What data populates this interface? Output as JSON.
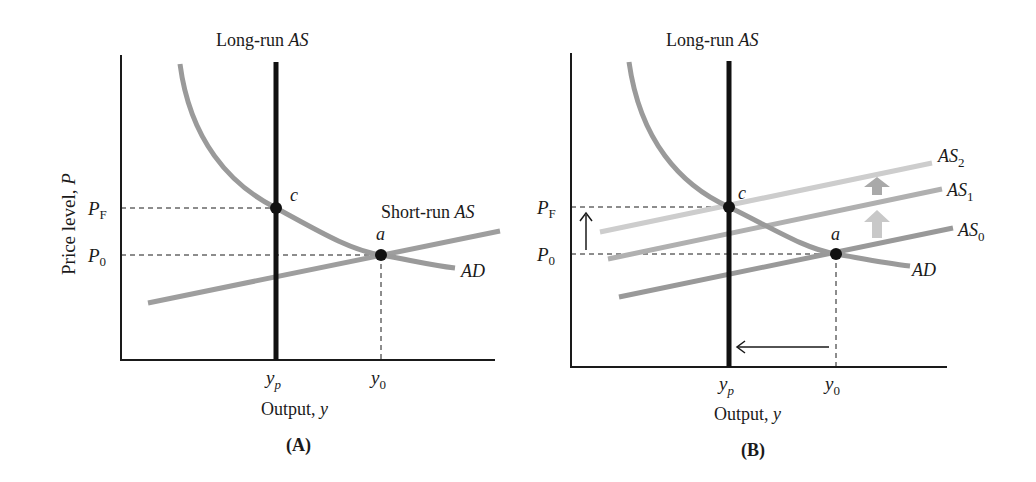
{
  "panels": [
    {
      "id": "A",
      "caption": "(A)",
      "top_label_prefix": "Long-run ",
      "top_label_italic": "AS",
      "y_axis_label_prefix": "Price level, ",
      "y_axis_label_italic": "P",
      "x_axis_label_prefix": "Output, ",
      "x_axis_label_italic": "y",
      "y_ticks": [
        {
          "main": "P",
          "sub": "F"
        },
        {
          "main": "P",
          "sub": "0"
        }
      ],
      "x_ticks": [
        {
          "main": "y",
          "sub": "p"
        },
        {
          "main": "y",
          "sub": "0"
        }
      ],
      "points": [
        {
          "label": "c"
        },
        {
          "label": "a"
        }
      ],
      "curves": {
        "srас_label_prefix": "Short-run ",
        "sras_label_italic": "AS",
        "ad_label": "AD"
      }
    },
    {
      "id": "B",
      "caption": "(B)",
      "top_label_prefix": "Long-run ",
      "top_label_italic": "AS",
      "x_axis_label_prefix": "Output, ",
      "x_axis_label_italic": "y",
      "y_ticks": [
        {
          "main": "P",
          "sub": "F"
        },
        {
          "main": "P",
          "sub": "0"
        }
      ],
      "x_ticks": [
        {
          "main": "y",
          "sub": "p"
        },
        {
          "main": "y",
          "sub": "0"
        }
      ],
      "points": [
        {
          "label": "c"
        },
        {
          "label": "a"
        }
      ],
      "curves": {
        "as_labels": [
          {
            "main": "AS",
            "sub": "2"
          },
          {
            "main": "AS",
            "sub": "1"
          },
          {
            "main": "AS",
            "sub": "0"
          }
        ],
        "ad_label": "AD"
      }
    }
  ],
  "colors": {
    "axis": "#1a1a1a",
    "lras": "#111111",
    "ad": "#9a9a9a",
    "sras": "#9e9e9e",
    "as0": "#999999",
    "as1": "#b0b0b0",
    "as2": "#cdcdcd",
    "shift_arrow_upper": "#a9a9a9",
    "shift_arrow_lower": "#c8c8c8"
  }
}
